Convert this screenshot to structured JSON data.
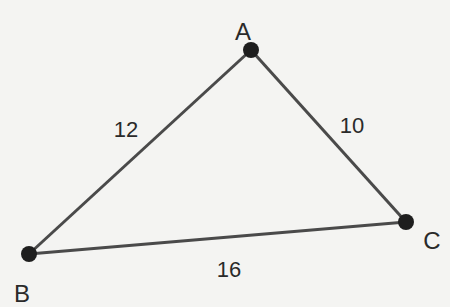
{
  "diagram": {
    "type": "triangle",
    "vertices": [
      {
        "id": "A",
        "label": "A",
        "x": 251,
        "y": 50,
        "lx": 243,
        "ly": 40
      },
      {
        "id": "B",
        "label": "B",
        "x": 29,
        "y": 254,
        "lx": 22,
        "ly": 302
      },
      {
        "id": "C",
        "label": "C",
        "x": 406,
        "y": 222,
        "lx": 432,
        "ly": 249
      }
    ],
    "edges": [
      {
        "from": "A",
        "to": "B",
        "label": "12",
        "lx": 126,
        "ly": 137
      },
      {
        "from": "A",
        "to": "C",
        "label": "10",
        "lx": 352,
        "ly": 133
      },
      {
        "from": "B",
        "to": "C",
        "label": "16",
        "lx": 229,
        "ly": 277
      }
    ],
    "colors": {
      "line": "#4a4a4a",
      "point": "#1e1e1e",
      "text": "#2a2a2a",
      "background": "#f4f4f2"
    }
  }
}
